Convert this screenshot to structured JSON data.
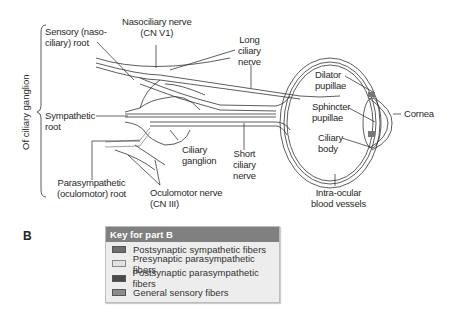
{
  "diagram": {
    "labels": {
      "sensory_root": [
        "Sensory (naso-",
        "ciliary) root"
      ],
      "nasociliary_nerve": [
        "Nasociliary nerve",
        "(CN V1)"
      ],
      "long_ciliary_nerve": [
        "Long",
        "ciliary",
        "nerve"
      ],
      "sympathetic_root": [
        "Sympathetic",
        "root"
      ],
      "ciliary_ganglion": [
        "Ciliary",
        "ganglion"
      ],
      "short_ciliary_nerve": [
        "Short",
        "ciliary",
        "nerve"
      ],
      "parasympathetic_root": [
        "Parasympathetic",
        "(oculomotor) root"
      ],
      "oculomotor_nerve": [
        "Oculomotor nerve",
        "(CN III)"
      ],
      "dilator_pupillae": [
        "Dilator",
        "pupillae"
      ],
      "sphincter_pupillae": [
        "Sphincter",
        "pupillae"
      ],
      "ciliary_body": [
        "Ciliary",
        "body"
      ],
      "cornea": "Cornea",
      "intraocular_vessels": [
        "Intra-ocular",
        "blood vessels"
      ],
      "bracket_label": "Of ciliary ganglion"
    }
  },
  "part_label": "B",
  "key": {
    "title": "Key for part B",
    "items": [
      {
        "label": "Postsynaptic sympathetic fibers",
        "color": "#6e6e6e"
      },
      {
        "label": "Presynaptic parasympathetic fibers",
        "color": "#e2e2e2"
      },
      {
        "label": "Postsynaptic parasympathetic fibers",
        "color": "#4a4a4a"
      },
      {
        "label": "General sensory fibers",
        "color": "#8c8c8c"
      }
    ]
  }
}
